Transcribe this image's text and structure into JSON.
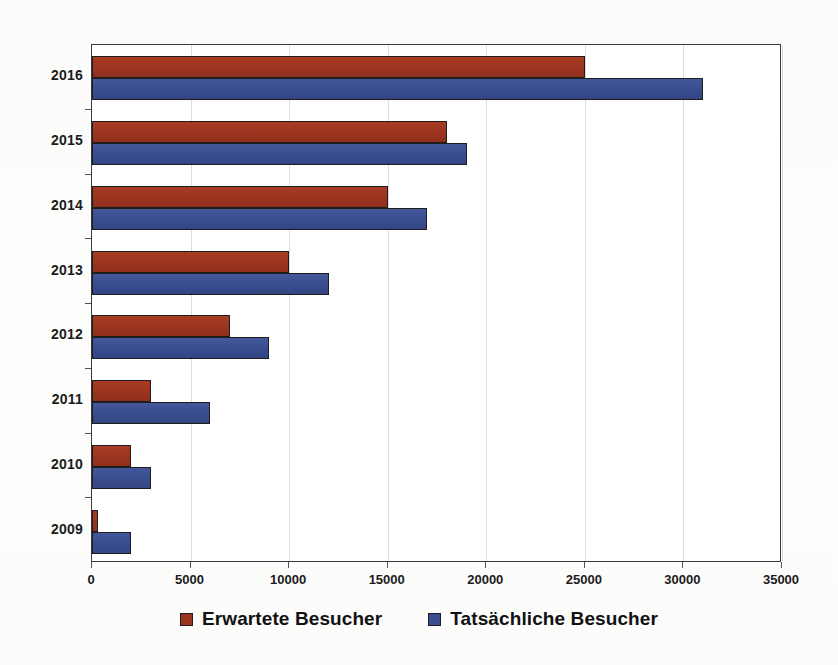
{
  "chart_data": {
    "type": "bar",
    "orientation": "horizontal",
    "title": "",
    "xlabel": "",
    "ylabel": "",
    "categories": [
      "2016",
      "2015",
      "2014",
      "2013",
      "2012",
      "2011",
      "2010",
      "2009"
    ],
    "series": [
      {
        "name": "Erwartete Besucher",
        "color": "#9c3520",
        "values": [
          25000,
          18000,
          15000,
          10000,
          7000,
          3000,
          2000,
          300
        ]
      },
      {
        "name": "Tatsächliche Besucher",
        "color": "#3a4d8f",
        "values": [
          31000,
          19000,
          17000,
          12000,
          9000,
          6000,
          3000,
          2000
        ]
      }
    ],
    "xlim": [
      0,
      35000
    ],
    "x_ticks": [
      0,
      5000,
      10000,
      15000,
      20000,
      25000,
      30000,
      35000
    ],
    "x_tick_labels": [
      "0",
      "5000",
      "10000",
      "15000",
      "20000",
      "25000",
      "30000",
      "35000"
    ],
    "grid": "vertical",
    "legend_position": "bottom"
  },
  "legend": {
    "items": [
      {
        "label": "Erwartete Besucher",
        "color": "#9c3520"
      },
      {
        "label": "Tatsächliche Besucher",
        "color": "#3a4d8f"
      }
    ]
  }
}
